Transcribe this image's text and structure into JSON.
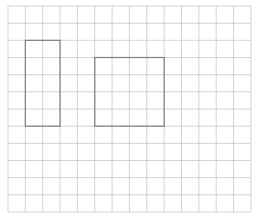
{
  "diagram": {
    "type": "grid-with-rectangles",
    "grid": {
      "origin_x": 8,
      "origin_y": 6,
      "cell_w": 17.35,
      "cell_h": 17.17,
      "cols": 14,
      "rows": 12,
      "line_color": "#c8c8c8"
    },
    "shapes": [
      {
        "name": "tall-rectangle",
        "col": 1,
        "row": 2,
        "cols": 2,
        "rows": 5,
        "stroke": "#808080"
      },
      {
        "name": "square-rectangle",
        "col": 5,
        "row": 3,
        "cols": 4,
        "rows": 4,
        "stroke": "#808080"
      }
    ]
  }
}
